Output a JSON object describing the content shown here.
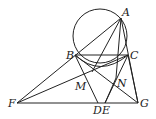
{
  "diagram": {
    "type": "geometry",
    "points": {
      "A": {
        "label": "A",
        "x": 121,
        "y": 18
      },
      "B": {
        "label": "B",
        "x": 75,
        "y": 55
      },
      "C": {
        "label": "C",
        "x": 128,
        "y": 55
      },
      "M": {
        "label": "M",
        "x": 92,
        "y": 72
      },
      "N": {
        "label": "N",
        "x": 116,
        "y": 78
      },
      "F": {
        "label": "F",
        "x": 17,
        "y": 103
      },
      "D": {
        "label": "D",
        "x": 98,
        "y": 103
      },
      "E": {
        "label": "E",
        "x": 105,
        "y": 103
      },
      "G": {
        "label": "G",
        "x": 138,
        "y": 103
      }
    },
    "circle": {
      "cx": 100,
      "cy": 36,
      "r": 27
    },
    "segments": [
      [
        "A",
        "F"
      ],
      [
        "A",
        "D"
      ],
      [
        "A",
        "E"
      ],
      [
        "A",
        "G"
      ],
      [
        "B",
        "C"
      ],
      [
        "B",
        "D"
      ],
      [
        "B",
        "G"
      ],
      [
        "C",
        "F"
      ],
      [
        "C",
        "E"
      ],
      [
        "C",
        "G"
      ],
      [
        "F",
        "G"
      ]
    ]
  }
}
